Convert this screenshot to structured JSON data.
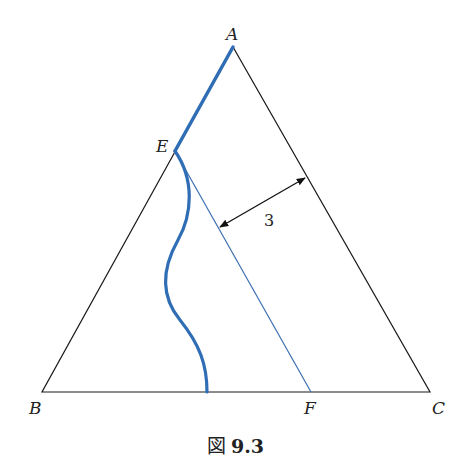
{
  "figure": {
    "caption_prefix": "図",
    "caption_number": "9.3"
  },
  "points": {
    "A": {
      "label": "A",
      "x": 233,
      "y": 47
    },
    "B": {
      "label": "B",
      "x": 42,
      "y": 392
    },
    "C": {
      "label": "C",
      "x": 430,
      "y": 392
    },
    "E": {
      "label": "E",
      "x": 175,
      "y": 151
    },
    "F": {
      "label": "F",
      "x": 311,
      "y": 392
    }
  },
  "annotations": {
    "distance_label": "3"
  },
  "colors": {
    "triangle": "#1a1a1a",
    "highlight_blue": "#2f6db5",
    "thin_blue": "#3a6fb0",
    "arrow": "#111111"
  }
}
